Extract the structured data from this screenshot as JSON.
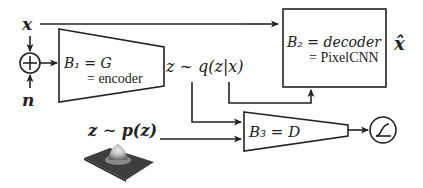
{
  "diagram": {
    "inputs": {
      "x_label": "x",
      "n_label": "n",
      "sum_symbol": "+"
    },
    "encoder": {
      "line1": "B₁ = G",
      "line2": "= encoder"
    },
    "latent": {
      "posterior_label": "z ∼ q(z|x)",
      "prior_label": "z ∼ p(z)"
    },
    "decoder": {
      "line1": "B₂ = decoder",
      "line2": "= PixelCNN",
      "output_label": "x̂"
    },
    "discriminator": {
      "label": "B₃ = D",
      "activation": "sigmoid"
    },
    "colors": {
      "stroke": "#222222",
      "background": "#ffffff",
      "gaussian_base": "#3a3a3a",
      "gaussian_peak": "#d8d8d8"
    }
  }
}
